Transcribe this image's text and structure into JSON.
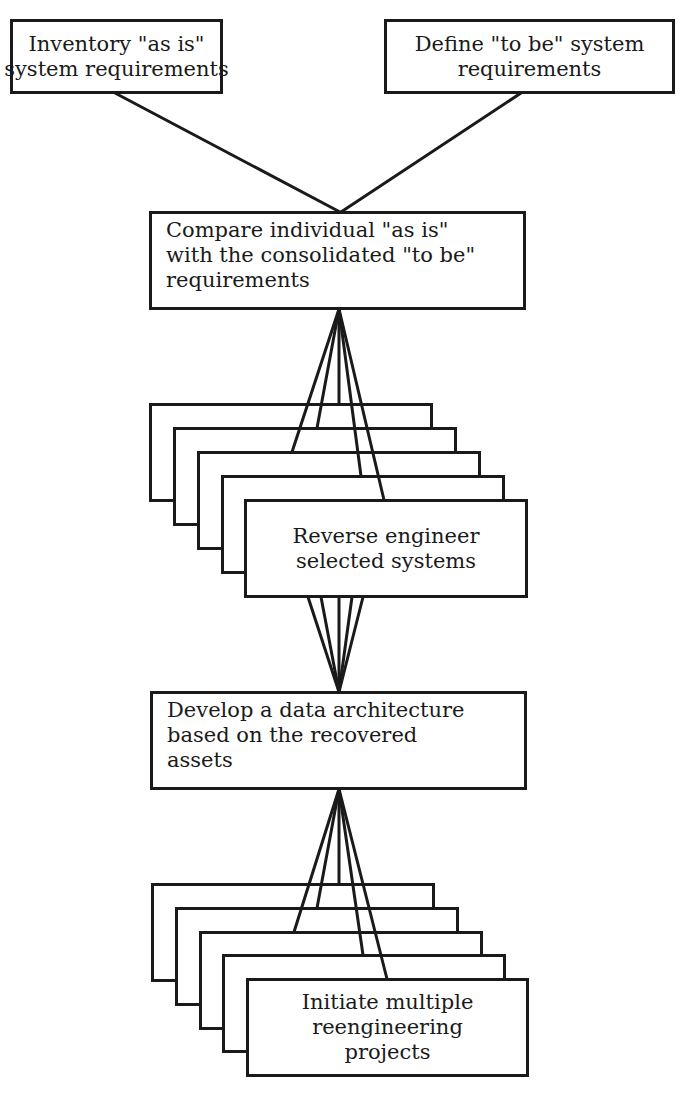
{
  "diagram": {
    "type": "process-flow",
    "colors": {
      "stroke": "#1a1a1a",
      "background": "#ffffff"
    },
    "nodes": {
      "inventory": {
        "lines": [
          "Inventory \"as is\"",
          "system requirements"
        ]
      },
      "define": {
        "lines": [
          "Define \"to be\" system",
          "requirements"
        ]
      },
      "compare": {
        "lines": [
          "Compare individual \"as is\"",
          "with the consolidated \"to be\"",
          "requirements"
        ]
      },
      "reverse": {
        "lines": [
          "Reverse engineer",
          "selected systems"
        ],
        "stacked_copies": 5
      },
      "develop": {
        "lines": [
          "Develop a data architecture",
          "based on the recovered",
          "assets"
        ]
      },
      "initiate": {
        "lines": [
          "Initiate multiple",
          "reengineering",
          "projects"
        ],
        "stacked_copies": 5
      }
    },
    "edges": [
      {
        "from": "inventory",
        "to": "compare"
      },
      {
        "from": "define",
        "to": "compare"
      },
      {
        "from": "compare",
        "to": "reverse",
        "fan_out": 5
      },
      {
        "from": "reverse",
        "to": "develop",
        "fan_in": 5
      },
      {
        "from": "develop",
        "to": "initiate",
        "fan_out": 5
      }
    ]
  }
}
